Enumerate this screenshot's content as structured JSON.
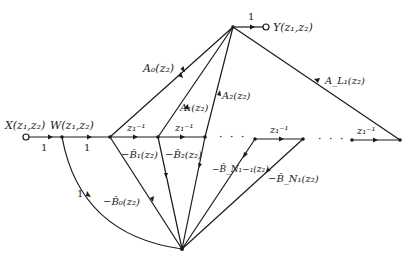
{
  "diagram": {
    "type": "signal-flow-graph",
    "input": {
      "label": "X(z₁,z₂)"
    },
    "internal": {
      "label": "W(z₁,z₂)"
    },
    "output": {
      "label": "Y(z₁,z₂)"
    },
    "gains": {
      "input_to_w": "1",
      "w_to_chain": "1",
      "to_output": "1",
      "feedback_return": "1"
    },
    "delays": [
      {
        "label": "z₁⁻¹"
      },
      {
        "label": "z₁⁻¹"
      },
      {
        "label": "z₁⁻¹"
      },
      {
        "label": "z₁⁻¹"
      }
    ],
    "feedforward": [
      {
        "label": "A₀(z₂)"
      },
      {
        "label": "A₁(z₂)"
      },
      {
        "label": "A₂(z₂)"
      },
      {
        "label": "A_L₁(z₂)"
      }
    ],
    "feedback": [
      {
        "label": "−B̂₀(z₂)"
      },
      {
        "label": "−B̂₁(z₂)"
      },
      {
        "label": "−B̂₂(z₂)"
      },
      {
        "label": "−B̂_N₁−₁(z₂)"
      },
      {
        "label": "−B̂_N₁(z₂)"
      }
    ],
    "ellipsis": "· · ·"
  }
}
